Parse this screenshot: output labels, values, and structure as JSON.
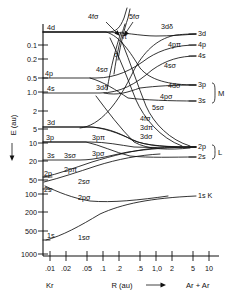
{
  "figure": {
    "type": "correlation-diagram",
    "axes": {
      "y_title": "E (au)",
      "y_arrow": "down",
      "x_title": "R (au)",
      "x_arrow": "right",
      "y_ticks": [
        "0.1",
        "0.2",
        "0.5",
        "1.0",
        "2",
        "5",
        "10",
        "20",
        "50",
        "100",
        "200",
        "500",
        "1000"
      ],
      "x_ticks": [
        ".01",
        ".02",
        ".05",
        ".1",
        ".2",
        ".5",
        "1,0",
        "2",
        "5",
        "10"
      ],
      "y_scale": "log-inverted",
      "x_scale": "log"
    },
    "limits": {
      "united_atom": "Kr",
      "separated_atoms": "Ar + Ar"
    },
    "left_levels": [
      {
        "label": "4d",
        "y": 32
      },
      {
        "label": "4p",
        "y": 78
      },
      {
        "label": "4s",
        "y": 93
      },
      {
        "label": "3d",
        "y": 127
      },
      {
        "label": "3p",
        "y": 142
      },
      {
        "label": "3s",
        "y": 160
      },
      {
        "label": "2p",
        "y": 177
      },
      {
        "label": "2s",
        "y": 189
      },
      {
        "label": "1s",
        "y": 240
      }
    ],
    "right_levels": [
      {
        "label": "3d",
        "y": 34
      },
      {
        "label": "4p",
        "y": 45
      },
      {
        "label": "4s",
        "y": 56
      },
      {
        "label": "3p",
        "y": 85
      },
      {
        "label": "3s",
        "y": 101
      },
      {
        "label": "2p",
        "y": 147
      },
      {
        "label": "2s",
        "y": 157
      },
      {
        "label": "1s K",
        "y": 196
      }
    ],
    "shell_brackets": [
      {
        "label": "M"
      },
      {
        "label": "L"
      }
    ],
    "molecular_orbital_labels": [
      {
        "text": "4fσ"
      },
      {
        "text": "5fσ"
      },
      {
        "text": "π"
      },
      {
        "text": "σ"
      },
      {
        "text": "3dδ"
      },
      {
        "text": "4pπ"
      },
      {
        "text": "4sσ"
      },
      {
        "text": "4dσ"
      },
      {
        "text": "4pσ"
      },
      {
        "text": "5sσ"
      },
      {
        "text": "3dδ"
      },
      {
        "text": "3pπ"
      },
      {
        "text": "3pσ"
      },
      {
        "text": "3sσ"
      },
      {
        "text": "2pπ"
      },
      {
        "text": "2sσ"
      },
      {
        "text": "2pσ"
      },
      {
        "text": "1sσ"
      }
    ],
    "center_annotation": [
      "4fσ",
      "3dπ",
      "3dσ"
    ],
    "colors": {
      "ink": "#111111",
      "background": "#ffffff"
    }
  }
}
